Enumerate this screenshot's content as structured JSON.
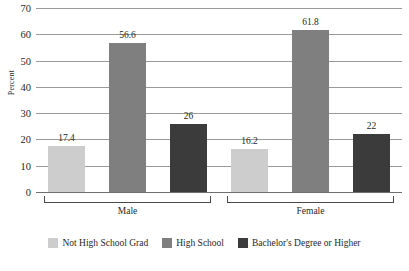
{
  "chart_data": {
    "type": "bar",
    "title": "",
    "xlabel": "",
    "ylabel": "Percent",
    "ylim": [
      0,
      70
    ],
    "ytick_labels": [
      "70",
      "60",
      "50",
      "40",
      "30",
      "20",
      "10",
      "0"
    ],
    "ytick_values": [
      70,
      60,
      50,
      40,
      30,
      20,
      10,
      0
    ],
    "grid": true,
    "legend_position": "bottom",
    "categories": [
      "Male",
      "Female"
    ],
    "series": [
      {
        "name": "Not High School Grad",
        "color": "#cdcdcd",
        "values": [
          17.4,
          16.2
        ],
        "labels": [
          "17.4",
          "16.2"
        ]
      },
      {
        "name": "High School",
        "color": "#7f7f7f",
        "values": [
          56.6,
          61.8
        ],
        "labels": [
          "56.6",
          "61.8"
        ]
      },
      {
        "name": "Bachelor's Degree or Higher",
        "color": "#3b3b3b",
        "values": [
          26,
          22
        ],
        "labels": [
          "26",
          "22"
        ]
      }
    ]
  },
  "axis": {
    "y_title": "Percent",
    "ticks": [
      {
        "label": "70"
      },
      {
        "label": "60"
      },
      {
        "label": "50"
      },
      {
        "label": "40"
      },
      {
        "label": "30"
      },
      {
        "label": "20"
      },
      {
        "label": "10"
      },
      {
        "label": "0"
      }
    ]
  },
  "groups": [
    {
      "name": "Male"
    },
    {
      "name": "Female"
    }
  ],
  "bars": [
    {
      "value_label": "17.4",
      "series": "Not High School Grad"
    },
    {
      "value_label": "56.6",
      "series": "High School"
    },
    {
      "value_label": "26",
      "series": "Bachelor's Degree or Higher"
    },
    {
      "value_label": "16.2",
      "series": "Not High School Grad"
    },
    {
      "value_label": "61.8",
      "series": "High School"
    },
    {
      "value_label": "22",
      "series": "Bachelor's Degree or Higher"
    }
  ],
  "legend": [
    {
      "label": "Not High School Grad",
      "color": "#cdcdcd"
    },
    {
      "label": "High School",
      "color": "#7f7f7f"
    },
    {
      "label": "Bachelor's Degree or Higher",
      "color": "#3b3b3b"
    }
  ]
}
